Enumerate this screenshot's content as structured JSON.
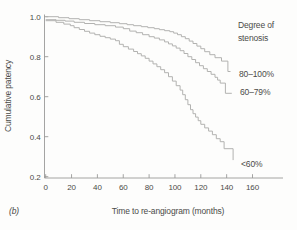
{
  "chart_data": {
    "type": "line",
    "subtype": "kaplan-meier-step",
    "title": "",
    "panel_label": "(b)",
    "xlabel": "Time to re-angiogram (months)",
    "ylabel": "Cumulative patency",
    "legend_title": [
      "Degree of",
      "stenosis"
    ],
    "x_ticks": [
      0,
      20,
      40,
      60,
      80,
      100,
      120,
      140,
      160
    ],
    "y_ticks": [
      1.0,
      0.8,
      0.6,
      0.4,
      0.2
    ],
    "y_tick_labels": [
      "1.0",
      "0.8",
      "0.6",
      "0.4",
      "0.2"
    ],
    "xlim": [
      0,
      183
    ],
    "ylim": [
      0.19,
      1.01
    ],
    "grid": false,
    "legend_position": "right",
    "colors": {
      "background": "#fdfdfc",
      "axis": "#9a9a98",
      "curve": "#b2b2b0",
      "text": "#4b4b48"
    },
    "series": [
      {
        "name": "80–100%",
        "points": [
          [
            0,
            1.0
          ],
          [
            10,
            0.995
          ],
          [
            18,
            0.99
          ],
          [
            26,
            0.985
          ],
          [
            34,
            0.98
          ],
          [
            42,
            0.975
          ],
          [
            50,
            0.97
          ],
          [
            57,
            0.965
          ],
          [
            63,
            0.96
          ],
          [
            68,
            0.955
          ],
          [
            74,
            0.95
          ],
          [
            79,
            0.945
          ],
          [
            84,
            0.94
          ],
          [
            88,
            0.935
          ],
          [
            92,
            0.93
          ],
          [
            96,
            0.925
          ],
          [
            99,
            0.918
          ],
          [
            102,
            0.91
          ],
          [
            105,
            0.9
          ],
          [
            108,
            0.89
          ],
          [
            111,
            0.878
          ],
          [
            114,
            0.866
          ],
          [
            117,
            0.853
          ],
          [
            120,
            0.84
          ],
          [
            123,
            0.825
          ],
          [
            127,
            0.81
          ],
          [
            131,
            0.795
          ],
          [
            136,
            0.778
          ],
          [
            141,
            0.726
          ],
          [
            143,
            0.726
          ]
        ]
      },
      {
        "name": "60–79%",
        "points": [
          [
            0,
            0.985
          ],
          [
            8,
            0.982
          ],
          [
            15,
            0.978
          ],
          [
            22,
            0.972
          ],
          [
            30,
            0.966
          ],
          [
            38,
            0.96
          ],
          [
            46,
            0.955
          ],
          [
            54,
            0.948
          ],
          [
            60,
            0.94
          ],
          [
            65,
            0.928
          ],
          [
            70,
            0.92
          ],
          [
            75,
            0.91
          ],
          [
            80,
            0.9
          ],
          [
            84,
            0.893
          ],
          [
            88,
            0.884
          ],
          [
            92,
            0.874
          ],
          [
            95,
            0.864
          ],
          [
            98,
            0.854
          ],
          [
            101,
            0.843
          ],
          [
            104,
            0.83
          ],
          [
            107,
            0.816
          ],
          [
            110,
            0.8
          ],
          [
            113,
            0.786
          ],
          [
            116,
            0.77
          ],
          [
            119,
            0.755
          ],
          [
            122,
            0.74
          ],
          [
            125,
            0.726
          ],
          [
            128,
            0.712
          ],
          [
            131,
            0.697
          ],
          [
            133,
            0.683
          ],
          [
            135,
            0.668
          ],
          [
            139,
            0.617
          ],
          [
            144,
            0.617
          ]
        ]
      },
      {
        "name": "<60%",
        "points": [
          [
            0,
            0.98
          ],
          [
            8,
            0.972
          ],
          [
            14,
            0.963
          ],
          [
            19,
            0.955
          ],
          [
            22,
            0.945
          ],
          [
            26,
            0.936
          ],
          [
            30,
            0.927
          ],
          [
            34,
            0.918
          ],
          [
            38,
            0.91
          ],
          [
            42,
            0.902
          ],
          [
            46,
            0.895
          ],
          [
            50,
            0.888
          ],
          [
            54,
            0.88
          ],
          [
            57,
            0.862
          ],
          [
            60,
            0.85
          ],
          [
            64,
            0.838
          ],
          [
            68,
            0.826
          ],
          [
            71,
            0.815
          ],
          [
            74,
            0.804
          ],
          [
            77,
            0.792
          ],
          [
            80,
            0.778
          ],
          [
            83,
            0.764
          ],
          [
            86,
            0.75
          ],
          [
            89,
            0.735
          ],
          [
            92,
            0.72
          ],
          [
            95,
            0.7
          ],
          [
            98,
            0.678
          ],
          [
            101,
            0.655
          ],
          [
            104,
            0.633
          ],
          [
            106,
            0.61
          ],
          [
            108,
            0.585
          ],
          [
            110,
            0.56
          ],
          [
            112,
            0.535
          ],
          [
            114,
            0.515
          ],
          [
            116,
            0.498
          ],
          [
            118,
            0.48
          ],
          [
            120,
            0.462
          ],
          [
            123,
            0.444
          ],
          [
            126,
            0.428
          ],
          [
            129,
            0.41
          ],
          [
            132,
            0.39
          ],
          [
            135,
            0.375
          ],
          [
            138,
            0.34
          ],
          [
            145,
            0.283
          ]
        ]
      }
    ]
  }
}
